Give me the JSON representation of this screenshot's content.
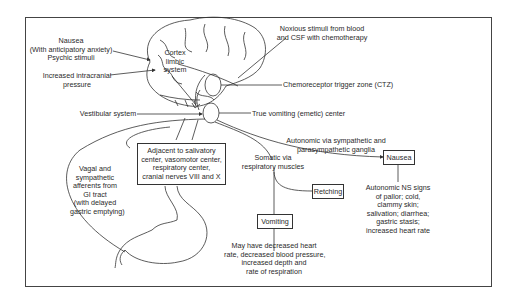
{
  "diagram": {
    "type": "physiology-pathway",
    "labels": {
      "nausea_psychic": [
        "Nausea",
        "(With anticipatory anxiety)",
        "Psychic stimuli"
      ],
      "intracranial": [
        "Increased intracranial",
        "pressure"
      ],
      "cortex": [
        "Cortex",
        "limbic",
        "system"
      ],
      "vestibular": "Vestibular system",
      "noxious": [
        "Noxious stimuli from blood",
        "and CSF with chemotherapy"
      ],
      "ctz": "Chemoreceptor trigger zone (CTZ)",
      "emetic_center": "True vomiting (emetic) center",
      "autonomic_path": [
        "Autonomic via sympathetic and",
        "parasympathetic ganglia"
      ],
      "vagal": [
        "Vagal and",
        "sympathetic",
        "afferents from",
        "GI tract",
        "(with delayed",
        "gastric emptying)"
      ],
      "somatic": [
        "Somatic via",
        "respiratory muscles"
      ],
      "autonomic_signs": [
        "Autonomic NS signs",
        "of pallor; cold,",
        "clammy skin;",
        "salivation; diarrhea;",
        "gastric stasis;",
        "increased heart rate"
      ],
      "vomiting_effects": [
        "May have decreased heart",
        "rate, decreased blood pressure,",
        "increased depth and",
        "rate of respiration"
      ]
    },
    "boxes": {
      "adjacent": [
        "Adjacent to salivatory",
        "center, vasomotor center,",
        "respiratory center,",
        "cranial nerves VIII and X"
      ],
      "nausea": "Nausea",
      "retching": "Retching",
      "vomiting": "Vomiting"
    },
    "colors": {
      "line": "#333333",
      "text": "#2a2a2a",
      "background": "#ffffff"
    }
  }
}
